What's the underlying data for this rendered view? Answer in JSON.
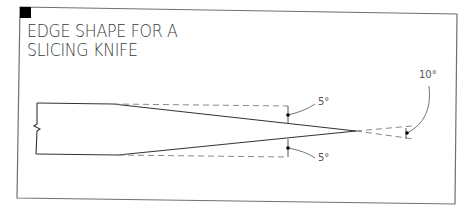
{
  "title": {
    "line1": "EDGE SHAPE FOR A",
    "line2": "SLICING KNIFE"
  },
  "annotations": {
    "upper_bevel_angle": "5°",
    "lower_bevel_angle": "5°",
    "included_angle": "10°"
  },
  "colors": {
    "frame": "#6e6e6e",
    "corner_marker": "#000000",
    "outline": "#333333",
    "dashed": "#888888",
    "text": "#3a3a3a"
  }
}
